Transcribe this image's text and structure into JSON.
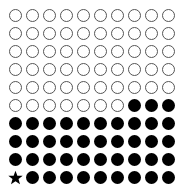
{
  "chart_data": {
    "type": "waffle",
    "title": "",
    "rows": 10,
    "columns": 10,
    "total": 100,
    "filled_count": 43,
    "empty_count": 57,
    "highlighted_cell": {
      "row": 10,
      "column": 1,
      "marker": "star"
    },
    "cells": [
      "o",
      "o",
      "o",
      "o",
      "o",
      "o",
      "o",
      "o",
      "o",
      "o",
      "o",
      "o",
      "o",
      "o",
      "o",
      "o",
      "o",
      "o",
      "o",
      "o",
      "o",
      "o",
      "o",
      "o",
      "o",
      "o",
      "o",
      "o",
      "o",
      "o",
      "o",
      "o",
      "o",
      "o",
      "o",
      "o",
      "o",
      "o",
      "o",
      "o",
      "o",
      "o",
      "o",
      "o",
      "o",
      "o",
      "o",
      "o",
      "o",
      "o",
      "o",
      "o",
      "o",
      "o",
      "o",
      "o",
      "o",
      "x",
      "x",
      "x",
      "x",
      "x",
      "x",
      "x",
      "x",
      "x",
      "x",
      "x",
      "x",
      "x",
      "x",
      "x",
      "x",
      "x",
      "x",
      "x",
      "x",
      "x",
      "x",
      "x",
      "x",
      "x",
      "x",
      "x",
      "x",
      "x",
      "x",
      "x",
      "x",
      "x",
      "*",
      "x",
      "x",
      "x",
      "x",
      "x",
      "x",
      "x",
      "x",
      "x"
    ],
    "colors": {
      "filled": "#000000",
      "empty_stroke": "#555555",
      "empty_fill": "#ffffff"
    }
  }
}
